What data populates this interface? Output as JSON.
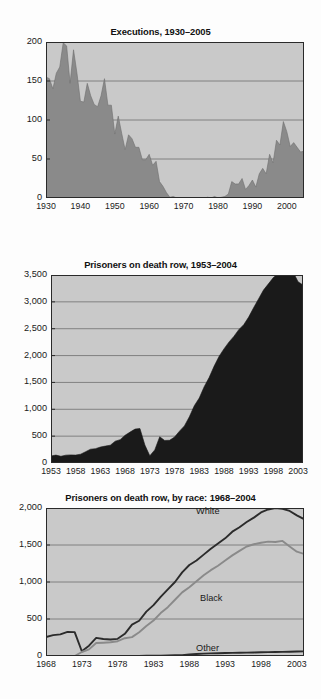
{
  "page": {
    "background": "#fdfdfd",
    "plot_background": "#c9c9c9",
    "gridline_color": "#6f6f6f",
    "axis_color": "#2a2a2a"
  },
  "figures": [
    {
      "id": "executions",
      "title": "Executions, 1930–2005",
      "colors": {
        "fill": "#8a8a8a",
        "line": "#6e6e6e"
      },
      "chart_data": {
        "type": "area",
        "title": "Executions, 1930–2005",
        "xlabel": "",
        "ylabel": "",
        "xlim": [
          1930,
          2005
        ],
        "ylim": [
          0,
          200
        ],
        "grid": true,
        "legend": "none",
        "yticks": [
          0,
          50,
          100,
          150,
          200
        ],
        "ytick_labels": [
          "0",
          "50",
          "100",
          "150",
          "200"
        ],
        "xticks": [
          1930,
          1940,
          1950,
          1960,
          1970,
          1980,
          1990,
          2000
        ],
        "xtick_labels": [
          "1930",
          "1940",
          "1950",
          "1960",
          "1970",
          "1980",
          "1990",
          "2000"
        ],
        "x": [
          1930,
          1931,
          1932,
          1933,
          1934,
          1935,
          1936,
          1937,
          1938,
          1939,
          1940,
          1941,
          1942,
          1943,
          1944,
          1945,
          1946,
          1947,
          1948,
          1949,
          1950,
          1951,
          1952,
          1953,
          1954,
          1955,
          1956,
          1957,
          1958,
          1959,
          1960,
          1961,
          1962,
          1963,
          1964,
          1965,
          1966,
          1967,
          1968,
          1969,
          1970,
          1971,
          1972,
          1973,
          1974,
          1975,
          1976,
          1977,
          1978,
          1979,
          1980,
          1981,
          1982,
          1983,
          1984,
          1985,
          1986,
          1987,
          1988,
          1989,
          1990,
          1991,
          1992,
          1993,
          1994,
          1995,
          1996,
          1997,
          1998,
          1999,
          2000,
          2001,
          2002,
          2003,
          2004,
          2005
        ],
        "values": [
          155,
          153,
          140,
          160,
          168,
          199,
          195,
          147,
          190,
          160,
          124,
          123,
          147,
          131,
          120,
          117,
          131,
          153,
          119,
          119,
          82,
          105,
          83,
          62,
          81,
          76,
          65,
          65,
          49,
          49,
          56,
          42,
          47,
          21,
          15,
          7,
          1,
          2,
          0,
          0,
          0,
          0,
          0,
          0,
          0,
          0,
          0,
          1,
          0,
          2,
          0,
          1,
          2,
          5,
          21,
          18,
          18,
          25,
          11,
          16,
          23,
          14,
          31,
          38,
          31,
          56,
          45,
          74,
          68,
          98,
          85,
          66,
          71,
          65,
          59,
          60
        ],
        "ylabel_note": "Number of executions"
      }
    },
    {
      "id": "death-row-total",
      "title": "Prisoners on death row, 1953–2004",
      "colors": {
        "fill": "#1a1a1a",
        "line": "#1a1a1a"
      },
      "chart_data": {
        "type": "area",
        "title": "Prisoners on death row, 1953–2004",
        "xlabel": "",
        "ylabel": "",
        "xlim": [
          1953,
          2004
        ],
        "ylim": [
          0,
          3500
        ],
        "grid": true,
        "legend": "none",
        "yticks": [
          0,
          500,
          1000,
          1500,
          2000,
          2500,
          3000,
          3500
        ],
        "ytick_labels": [
          "0",
          "500",
          "1,000",
          "1,500",
          "2,000",
          "2,500",
          "3,000",
          "3,500"
        ],
        "xticks": [
          1953,
          1958,
          1963,
          1968,
          1973,
          1978,
          1983,
          1988,
          1993,
          1998,
          2003
        ],
        "xtick_labels": [
          "1953",
          "1958",
          "1963",
          "1968",
          "1973",
          "1978",
          "1983",
          "1988",
          "1993",
          "1998",
          "2003"
        ],
        "x": [
          1953,
          1954,
          1955,
          1956,
          1957,
          1958,
          1959,
          1960,
          1961,
          1962,
          1963,
          1964,
          1965,
          1966,
          1967,
          1968,
          1969,
          1970,
          1971,
          1972,
          1973,
          1974,
          1975,
          1976,
          1977,
          1978,
          1979,
          1980,
          1981,
          1982,
          1983,
          1984,
          1985,
          1986,
          1987,
          1988,
          1989,
          1990,
          1991,
          1992,
          1993,
          1994,
          1995,
          1996,
          1997,
          1998,
          1999,
          2000,
          2001,
          2002,
          2003,
          2004
        ],
        "values": [
          131,
          147,
          125,
          146,
          151,
          147,
          164,
          210,
          257,
          267,
          297,
          315,
          331,
          406,
          435,
          517,
          575,
          631,
          642,
          334,
          134,
          244,
          488,
          420,
          423,
          482,
          593,
          691,
          860,
          1066,
          1209,
          1420,
          1591,
          1800,
          1984,
          2124,
          2250,
          2356,
          2482,
          2575,
          2716,
          2890,
          3054,
          3219,
          3335,
          3452,
          3527,
          3593,
          3581,
          3557,
          3374,
          3314
        ]
      }
    },
    {
      "id": "death-row-by-race",
      "title": "Prisoners on death row, by race: 1968–2004",
      "colors": {
        "white": "#2b2b2b",
        "black": "#8a8a8a",
        "other": "#2b2b2b"
      },
      "chart_data": {
        "type": "line",
        "title": "Prisoners on death row, by race: 1968–2004",
        "xlabel": "",
        "ylabel": "",
        "xlim": [
          1968,
          2004
        ],
        "ylim": [
          0,
          2000
        ],
        "grid": true,
        "legend": "inline-annotations",
        "yticks": [
          0,
          500,
          1000,
          1500,
          2000
        ],
        "ytick_labels": [
          "0",
          "500",
          "1,000",
          "1,500",
          "2,000"
        ],
        "xticks": [
          1968,
          1973,
          1978,
          1983,
          1988,
          1993,
          1998,
          2003
        ],
        "xtick_labels": [
          "1968",
          "1973",
          "1978",
          "1983",
          "1988",
          "1993",
          "1998",
          "2003"
        ],
        "x": [
          1968,
          1969,
          1970,
          1971,
          1972,
          1973,
          1974,
          1975,
          1976,
          1977,
          1978,
          1979,
          1980,
          1981,
          1982,
          1983,
          1984,
          1985,
          1986,
          1987,
          1988,
          1989,
          1990,
          1991,
          1992,
          1993,
          1994,
          1995,
          1996,
          1997,
          1998,
          1999,
          2000,
          2001,
          2002,
          2003,
          2004
        ],
        "series": [
          {
            "name": "White",
            "color": "#2b2b2b",
            "values": [
              257,
              282,
              292,
              325,
              322,
              64,
              140,
              245,
              229,
              223,
              232,
              300,
              424,
              476,
              600,
              688,
              800,
              900,
              1000,
              1130,
              1230,
              1290,
              1370,
              1450,
              1520,
              1590,
              1680,
              1740,
              1810,
              1870,
              1940,
              1980,
              2000,
              1990,
              1960,
              1900,
              1850
            ]
          },
          {
            "name": "Black",
            "color": "#8a8a8a",
            "values": [
              0,
              0,
              0,
              0,
              0,
              54,
              90,
              175,
              180,
              185,
              200,
              240,
              255,
              320,
              405,
              480,
              580,
              660,
              760,
              860,
              930,
              1010,
              1090,
              1160,
              1220,
              1290,
              1360,
              1420,
              1480,
              1510,
              1530,
              1545,
              1540,
              1555,
              1480,
              1410,
              1380
            ]
          },
          {
            "name": "Other",
            "color": "#2b2b2b",
            "values": [
              0,
              0,
              0,
              0,
              0,
              0,
              0,
              0,
              0,
              0,
              0,
              0,
              0,
              2,
              3,
              4,
              5,
              8,
              10,
              12,
              22,
              28,
              32,
              35,
              38,
              40,
              42,
              44,
              46,
              48,
              50,
              52,
              55,
              56,
              58,
              60,
              62
            ]
          }
        ]
      }
    }
  ]
}
